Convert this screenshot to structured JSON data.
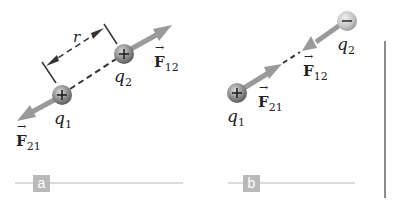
{
  "panels": [
    {
      "tag": "a",
      "charges": [
        {
          "name": "q",
          "sub": "1",
          "sign": "+"
        },
        {
          "name": "q",
          "sub": "2",
          "sign": "+"
        }
      ],
      "forces": [
        {
          "name": "F",
          "sub": "21",
          "direction": "away"
        },
        {
          "name": "F",
          "sub": "12",
          "direction": "away"
        }
      ],
      "distance_label": "r"
    },
    {
      "tag": "b",
      "charges": [
        {
          "name": "q",
          "sub": "1",
          "sign": "+"
        },
        {
          "name": "q",
          "sub": "2",
          "sign": "−"
        }
      ],
      "forces": [
        {
          "name": "F",
          "sub": "21",
          "direction": "toward"
        },
        {
          "name": "F",
          "sub": "12",
          "direction": "toward"
        }
      ]
    }
  ],
  "colors": {
    "arrow": "#9a9a9a",
    "charge": "#8a8a8a",
    "tag_bg": "#b9b9b9",
    "rule": "#cfcfcf",
    "divider": "#8c8c8c"
  }
}
